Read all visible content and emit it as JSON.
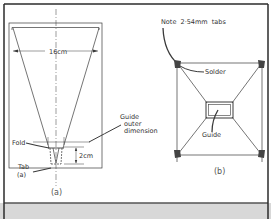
{
  "figure": {
    "panel_a": {
      "caption": "(a)",
      "width_label": "16cm",
      "fold_label": "Fold",
      "tab_label_line1": "Tab",
      "tab_label_line2": "(a)",
      "tab_height_label": "2cm",
      "guide_label_line1": "Guide",
      "guide_label_line2": "outer",
      "guide_label_line3": "dimension"
    },
    "panel_b": {
      "caption": "(b)",
      "note_label": "Note  2·54mm  tabs",
      "solder_label": "Solder",
      "guide_label": "Guide"
    }
  },
  "colors": {
    "line": "#3a3a3a",
    "frame": "#2b2b2b",
    "footer_band": "#d8d8d8",
    "background": "#ffffff"
  }
}
